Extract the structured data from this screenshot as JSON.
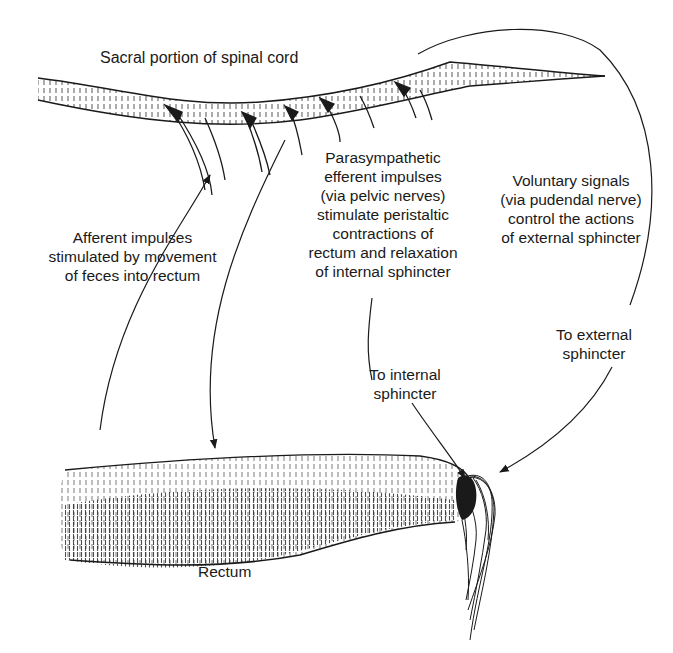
{
  "diagram": {
    "labels": {
      "spinal_cord": "Sacral portion of spinal cord",
      "afferent": [
        "Afferent impulses",
        "stimulated by movement",
        "of feces into rectum"
      ],
      "parasympathetic": [
        "Parasympathetic",
        "efferent impulses",
        "(via pelvic nerves)",
        "stimulate peristaltic",
        "contractions of",
        "rectum and relaxation",
        "of internal sphincter"
      ],
      "voluntary": [
        "Voluntary signals",
        "(via pudendal nerve)",
        "control the actions",
        "of external sphincter"
      ],
      "to_external": [
        "To external",
        "sphincter"
      ],
      "to_internal": [
        "To internal",
        "sphincter"
      ],
      "rectum": "Rectum"
    },
    "structures": [
      "spinal-cord",
      "nerve-roots",
      "rectum",
      "internal-sphincter",
      "external-sphincter"
    ],
    "pathways": [
      {
        "name": "afferent-pathway",
        "from": "rectum",
        "to": "spinal-cord"
      },
      {
        "name": "parasympathetic-pathway",
        "from": "spinal-cord",
        "to": "rectum"
      },
      {
        "name": "internal-sphincter-pathway",
        "from": "spinal-cord",
        "to": "internal-sphincter"
      },
      {
        "name": "voluntary-pathway",
        "from": "spinal-cord",
        "to": "external-sphincter"
      }
    ],
    "colors": {
      "ink": "#1a1a1a",
      "background": "#ffffff"
    }
  }
}
